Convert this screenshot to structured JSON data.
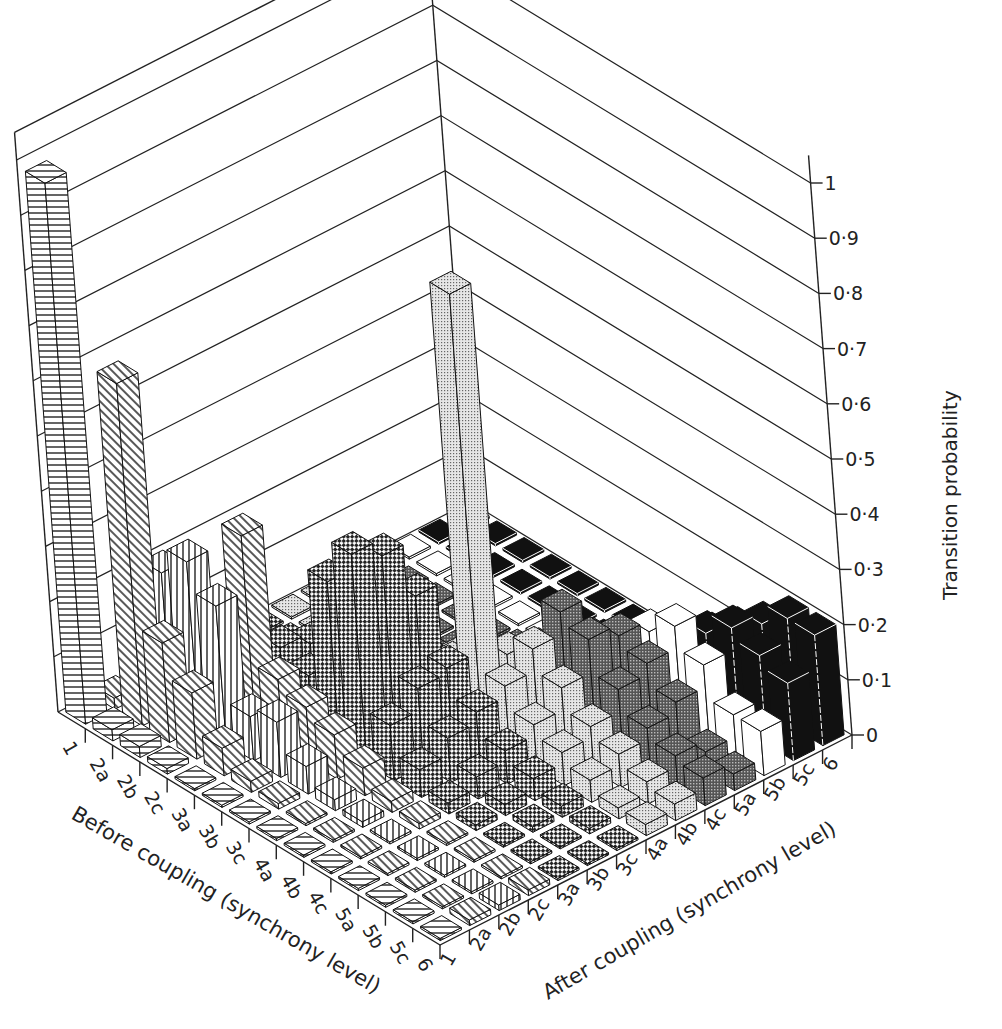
{
  "chart_data": {
    "type": "bar3d",
    "title": "",
    "xlabel": "Before coupling (synchrony level)",
    "ylabel": "After coupling (synchrony level)",
    "zlabel": "Transition probability",
    "before_levels": [
      "1",
      "2a",
      "2b",
      "2c",
      "3a",
      "3b",
      "3c",
      "4a",
      "4b",
      "4c",
      "5a",
      "5b",
      "5c",
      "6"
    ],
    "after_levels": [
      "1",
      "2a",
      "2b",
      "2c",
      "3a",
      "3b",
      "3c",
      "4a",
      "4b",
      "4c",
      "5a",
      "5b",
      "5c",
      "6"
    ],
    "z_ticks": [
      "0",
      "0·1",
      "0·2",
      "0·3",
      "0·4",
      "0·5",
      "0·6",
      "0·7",
      "0·8",
      "0·9",
      "1"
    ],
    "zlim": [
      0,
      1
    ],
    "grid": true,
    "legend": "none",
    "series_by_after_level_patterns": {
      "1": "horizontal-stripes",
      "2a": "diagonal-stripes",
      "2b": "vertical-stripes",
      "2c": "diagonal-stripes",
      "3a": "coarse-checker",
      "3b": "coarse-checker",
      "3c": "coarse-checker",
      "4a": "light-dots",
      "4b": "light-dots",
      "4c": "dark-dots",
      "5a": "dark-dots",
      "5b": "white",
      "5c": "black",
      "6": "black"
    },
    "values": [
      [
        0.98,
        0.02,
        0.02,
        0.01,
        0,
        0,
        0,
        0,
        0,
        0,
        0,
        0,
        0,
        0
      ],
      [
        0.02,
        0.62,
        0.25,
        0.05,
        0.02,
        0.01,
        0.01,
        0,
        0,
        0,
        0,
        0,
        0,
        0
      ],
      [
        0.02,
        0.18,
        0.3,
        0.1,
        0.06,
        0.05,
        0.02,
        0,
        0,
        0,
        0,
        0,
        0,
        0
      ],
      [
        0.01,
        0.12,
        0.25,
        0.35,
        0.12,
        0.1,
        0.05,
        0.02,
        0,
        0,
        0,
        0,
        0,
        0
      ],
      [
        0,
        0.05,
        0.08,
        0.12,
        0.1,
        0.14,
        0.1,
        0.05,
        0.02,
        0.01,
        0,
        0,
        0,
        0
      ],
      [
        0,
        0.02,
        0.1,
        0.1,
        0.3,
        0.25,
        0.14,
        0.08,
        0.05,
        0.02,
        0.01,
        0,
        0,
        0
      ],
      [
        0,
        0.01,
        0.05,
        0.08,
        0.38,
        0.35,
        0.25,
        0.1,
        0.08,
        0.04,
        0.02,
        0.01,
        0,
        0
      ],
      [
        0,
        0,
        0.02,
        0.05,
        0.1,
        0.14,
        0.15,
        0.8,
        0.12,
        0.1,
        0.06,
        0.04,
        0.02,
        0.01
      ],
      [
        0,
        0,
        0.01,
        0.02,
        0.05,
        0.08,
        0.1,
        0.12,
        0.16,
        0.2,
        0.12,
        0.08,
        0.05,
        0.02
      ],
      [
        0,
        0,
        0,
        0.01,
        0.02,
        0.04,
        0.06,
        0.08,
        0.12,
        0.18,
        0.16,
        0.14,
        0.1,
        0.08
      ],
      [
        0,
        0,
        0,
        0,
        0.01,
        0.02,
        0.04,
        0.06,
        0.08,
        0.12,
        0.14,
        0.18,
        0.14,
        0.12
      ],
      [
        0,
        0,
        0,
        0,
        0,
        0.01,
        0.02,
        0.04,
        0.06,
        0.08,
        0.1,
        0.14,
        0.18,
        0.16
      ],
      [
        0,
        0,
        0,
        0,
        0,
        0,
        0.01,
        0.02,
        0.04,
        0.06,
        0.04,
        0.08,
        0.16,
        0.2
      ],
      [
        0,
        0.01,
        0.01,
        0.01,
        0,
        0,
        0,
        0.02,
        0.03,
        0.05,
        0.03,
        0.08,
        0.14,
        0.2
      ]
    ]
  }
}
